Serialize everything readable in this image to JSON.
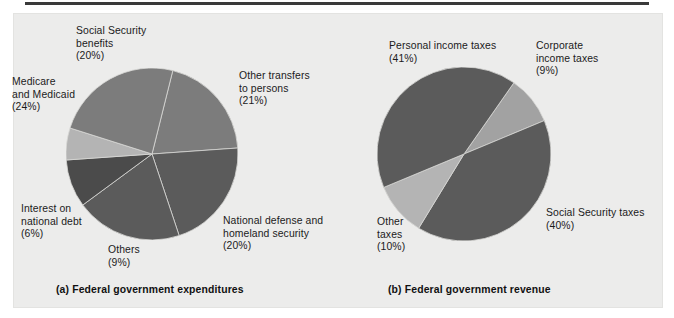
{
  "figure": {
    "background_color": "#ececeb",
    "page_color": "#ffffff",
    "rule_color": "#3a3a3a"
  },
  "captions": {
    "a": "(a) Federal government expenditures",
    "b": "(b) Federal government revenue"
  },
  "palette": {
    "dark": "#5b5b5b",
    "darkest": "#4b4b4b",
    "medium": "#7c7c7c",
    "light": "#a9a9a9",
    "lighter": "#c2c2c2"
  },
  "chart_data": [
    {
      "type": "pie",
      "title": "(a) Federal government expenditures",
      "center": [
        152,
        154
      ],
      "radius": 86,
      "start_angle_deg": -76,
      "categories": [
        "Social Security benefits",
        "Other transfers to persons",
        "National defense and homeland security",
        "Others",
        "Interest on national debt",
        "Medicare and Medicaid"
      ],
      "values": [
        20,
        21,
        20,
        9,
        6,
        24
      ],
      "value_labels": [
        "(20%)",
        "(21%)",
        "(20%)",
        "(9%)",
        "(6%)",
        "(24%)"
      ],
      "colors": [
        "#7c7c7c",
        "#5b5b5b",
        "#5b5b5b",
        "#4b4b4b",
        "#b4b4b4",
        "#7c7c7c"
      ],
      "slices": [
        {
          "name": "Social Security benefits",
          "label_lines": [
            "Social Security",
            "benefits",
            "(20%)"
          ],
          "percent": 20,
          "color": "#7c7c7c"
        },
        {
          "name": "Other transfers to persons",
          "label_lines": [
            "Other transfers",
            "to persons",
            "(21%)"
          ],
          "percent": 21,
          "color": "#5b5b5b"
        },
        {
          "name": "National defense and homeland security",
          "label_lines": [
            "National defense and",
            "homeland security",
            "(20%)"
          ],
          "percent": 20,
          "color": "#5b5b5b"
        },
        {
          "name": "Others",
          "label_lines": [
            "Others",
            "(9%)"
          ],
          "percent": 9,
          "color": "#4b4b4b"
        },
        {
          "name": "Interest on national debt",
          "label_lines": [
            "Interest on",
            "national debt",
            "(6%)"
          ],
          "percent": 6,
          "color": "#b4b4b4"
        },
        {
          "name": "Medicare and Medicaid",
          "label_lines": [
            "Medicare",
            "and Medicaid",
            "(24%)"
          ],
          "percent": 24,
          "color": "#7c7c7c"
        }
      ],
      "ylabel": "",
      "xlabel": "",
      "grid": false,
      "legend": "none"
    },
    {
      "type": "pie",
      "title": "(b) Federal government revenue",
      "center": [
        464,
        154
      ],
      "radius": 87,
      "start_angle_deg": -55,
      "categories": [
        "Corporate income taxes",
        "Social Security taxes",
        "Other taxes",
        "Personal income taxes"
      ],
      "values": [
        9,
        40,
        10,
        41
      ],
      "value_labels": [
        "(9%)",
        "(40%)",
        "(10%)",
        "(41%)"
      ],
      "colors": [
        "#a2a2a2",
        "#5b5b5b",
        "#b4b4b4",
        "#5b5b5b"
      ],
      "slices": [
        {
          "name": "Corporate income taxes",
          "label_lines": [
            "Corporate",
            "income taxes",
            "(9%)"
          ],
          "percent": 9,
          "color": "#a2a2a2"
        },
        {
          "name": "Social Security taxes",
          "label_lines": [
            "Social Security taxes",
            "(40%)"
          ],
          "percent": 40,
          "color": "#5b5b5b"
        },
        {
          "name": "Other taxes",
          "label_lines": [
            "Other",
            "taxes",
            "(10%)"
          ],
          "percent": 10,
          "color": "#b4b4b4"
        },
        {
          "name": "Personal income taxes",
          "label_lines": [
            "Personal income taxes",
            "(41%)"
          ],
          "percent": 41,
          "color": "#5b5b5b"
        }
      ],
      "ylabel": "",
      "xlabel": "",
      "grid": false,
      "legend": "none"
    }
  ],
  "labels_a": {
    "social_security_benefits": "Social Security\nbenefits\n(20%)",
    "medicare_and_medicaid": "Medicare\nand Medicaid\n(24%)",
    "other_transfers": "Other transfers\nto persons\n(21%)",
    "interest_on_debt": "Interest on\nnational debt\n(6%)",
    "others": "Others\n(9%)",
    "national_defense": "National defense and\nhomeland security\n(20%)"
  },
  "labels_b": {
    "personal_income_taxes": "Personal income taxes\n(41%)",
    "corporate_income_taxes": "Corporate\nincome taxes\n(9%)",
    "social_security_taxes": "Social Security taxes\n(40%)",
    "other_taxes": "Other\ntaxes\n(10%)"
  }
}
